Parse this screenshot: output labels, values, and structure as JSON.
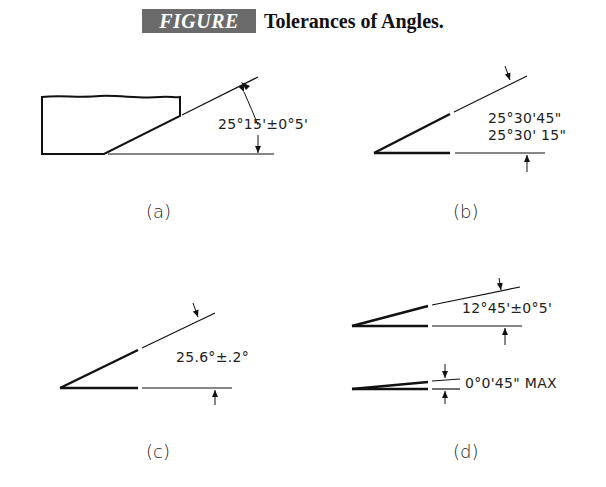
{
  "figure": {
    "label": "FIGURE 12.28",
    "title": "Tolerances of Angles.",
    "banner_color": "#6b6b6b"
  },
  "panels": [
    {
      "id": "a",
      "caption": "(a)",
      "dimension": "25°15'±0°5'",
      "note": "Bevelled part with angle dimension"
    },
    {
      "id": "b",
      "caption": "(b)",
      "dimension_upper": "25°30'45\"",
      "dimension_lower": "25°30' 15\"",
      "note": "Limit dimensions"
    },
    {
      "id": "c",
      "caption": "(c)",
      "dimension": "25.6°±.2°",
      "note": "Decimal degrees"
    },
    {
      "id": "d",
      "caption": "(d)",
      "dimension": "12°45'±0°5'",
      "dimension_max": "0°0'45\" MAX",
      "note": "Small angles"
    }
  ]
}
